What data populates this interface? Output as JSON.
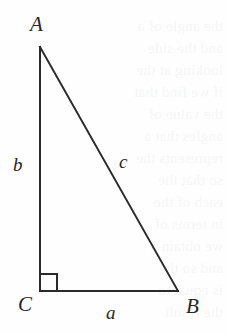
{
  "figure": {
    "background_color": "#fefefe",
    "stroke_color": "#2a2a2a",
    "stroke_width": 2,
    "right_angle_marker": {
      "at_vertex": "C",
      "size": 17,
      "label": "right-angle-mark"
    },
    "vertices": [
      {
        "id": "A",
        "label": "A",
        "x": 40,
        "y": 47,
        "label_x": 30,
        "label_y": 14
      },
      {
        "id": "C",
        "label": "C",
        "x": 40,
        "y": 291,
        "label_x": 18,
        "label_y": 294
      },
      {
        "id": "B",
        "label": "B",
        "x": 178,
        "y": 291,
        "label_x": 186,
        "label_y": 296
      }
    ],
    "sides": [
      {
        "id": "a",
        "label": "a",
        "from": "C",
        "to": "B",
        "role": "base",
        "label_x": 106,
        "label_y": 303
      },
      {
        "id": "b",
        "label": "b",
        "from": "A",
        "to": "C",
        "role": "leg",
        "label_x": 13,
        "label_y": 155
      },
      {
        "id": "c",
        "label": "c",
        "from": "A",
        "to": "B",
        "role": "hypotenuse",
        "label_x": 119,
        "label_y": 152
      }
    ]
  },
  "ghost_text": {
    "color": "#f6f6f6",
    "lines": [
      {
        "text": "the angle of a",
        "top": 18
      },
      {
        "text": "and the side",
        "top": 40
      },
      {
        "text": "looking at the",
        "top": 62
      },
      {
        "text": "if we find that",
        "top": 84
      },
      {
        "text": "the value of",
        "top": 106
      },
      {
        "text": "angles that a",
        "top": 128
      },
      {
        "text": "represents the",
        "top": 150
      },
      {
        "text": "so that the",
        "top": 172
      },
      {
        "text": "each of the",
        "top": 194
      },
      {
        "text": "in terms of",
        "top": 216
      },
      {
        "text": "we obtain a",
        "top": 238
      },
      {
        "text": "and so the",
        "top": 260
      },
      {
        "text": "is equal to",
        "top": 282
      },
      {
        "text": "the result",
        "top": 304
      }
    ]
  }
}
